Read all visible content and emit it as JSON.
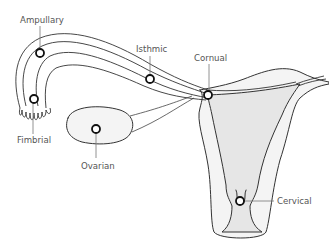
{
  "diagram": {
    "colors": {
      "outline": "#333333",
      "cavity_fill": "#e6e6e6",
      "organ_fill": "#f4f4f4",
      "label_text": "#555555",
      "marker_stroke": "#111111"
    },
    "labels": {
      "ampullary": "Ampullary",
      "isthmic": "Isthmic",
      "cornual": "Cornual",
      "fimbrial": "Fimbrial",
      "ovarian": "Ovarian",
      "cervical": "Cervical"
    },
    "sites": [
      {
        "name": "Ampullary",
        "x": 40,
        "y": 53
      },
      {
        "name": "Isthmic",
        "x": 150,
        "y": 79
      },
      {
        "name": "Cornual",
        "x": 208,
        "y": 95
      },
      {
        "name": "Fimbrial",
        "x": 34,
        "y": 99
      },
      {
        "name": "Ovarian",
        "x": 96,
        "y": 129
      },
      {
        "name": "Cervical",
        "x": 240,
        "y": 201
      }
    ]
  }
}
